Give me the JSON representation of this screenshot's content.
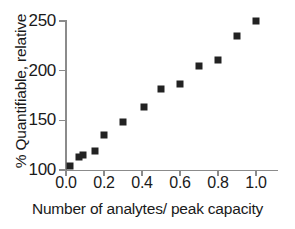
{
  "chart_data": {
    "type": "scatter",
    "title": "",
    "xlabel": "Number of analytes/ peak capacity",
    "ylabel": "% Quantifiable, relative",
    "xlim": [
      0.0,
      1.0
    ],
    "ylim": [
      100,
      250
    ],
    "grid": false,
    "legend": null,
    "marker": "filled-square",
    "marker_color": "#222222",
    "axis_color": "#8b8b8b",
    "xticks": [
      0.0,
      0.2,
      0.4,
      0.6,
      0.8,
      1.0
    ],
    "xticklabels": [
      "0.0",
      "0.2",
      "0.4",
      "0.6",
      "0.8",
      "1.0"
    ],
    "yticks": [
      100,
      150,
      200,
      250
    ],
    "yticklabels": [
      "100",
      "150",
      "200",
      "250"
    ],
    "x": [
      0.02,
      0.07,
      0.09,
      0.15,
      0.2,
      0.3,
      0.41,
      0.5,
      0.6,
      0.7,
      0.8,
      0.9,
      1.0
    ],
    "values": [
      104,
      113,
      115,
      119,
      135,
      148,
      163,
      182,
      187,
      205,
      211,
      235,
      250
    ],
    "series": [
      {
        "name": "% Quantifiable",
        "points": [
          {
            "x": 0.02,
            "y": 104
          },
          {
            "x": 0.07,
            "y": 113
          },
          {
            "x": 0.09,
            "y": 115
          },
          {
            "x": 0.15,
            "y": 119
          },
          {
            "x": 0.2,
            "y": 135
          },
          {
            "x": 0.3,
            "y": 148
          },
          {
            "x": 0.41,
            "y": 163
          },
          {
            "x": 0.5,
            "y": 182
          },
          {
            "x": 0.6,
            "y": 187
          },
          {
            "x": 0.7,
            "y": 205
          },
          {
            "x": 0.8,
            "y": 211
          },
          {
            "x": 0.9,
            "y": 235
          },
          {
            "x": 1.0,
            "y": 250
          }
        ]
      }
    ]
  }
}
